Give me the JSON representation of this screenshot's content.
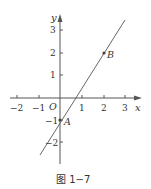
{
  "figure": {
    "caption": "图 1−7",
    "axes": {
      "x_label": "x",
      "y_label": "y",
      "origin_label": "O",
      "x_ticks": [
        {
          "value": -2,
          "label": "−2"
        },
        {
          "value": -1,
          "label": "−1"
        },
        {
          "value": 1,
          "label": "1"
        },
        {
          "value": 2,
          "label": "2"
        },
        {
          "value": 3,
          "label": "3"
        }
      ],
      "y_ticks": [
        {
          "value": 3,
          "label": "3"
        },
        {
          "value": 2,
          "label": "2"
        },
        {
          "value": 1,
          "label": "1"
        },
        {
          "value": -1,
          "label": "−1"
        },
        {
          "value": -2,
          "label": "−2"
        }
      ]
    },
    "points": [
      {
        "name": "A",
        "x": 0,
        "y": -1
      },
      {
        "name": "B",
        "x": 2,
        "y": 2
      }
    ],
    "line": {
      "through": [
        "A",
        "B"
      ],
      "slope": 1.5,
      "intercept": -1
    },
    "colors": {
      "axis": "#555555",
      "line": "#666666",
      "text": "#333333"
    }
  }
}
